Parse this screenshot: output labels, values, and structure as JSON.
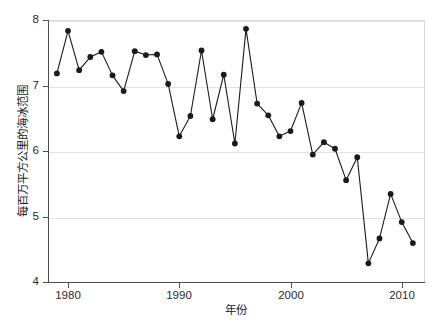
{
  "chart_data": {
    "type": "line",
    "title": "",
    "xlabel": "年份",
    "ylabel": "每百万平方公里的海冰范围",
    "xlim": [
      1978.2,
      2012.0
    ],
    "ylim": [
      4,
      8
    ],
    "grid": true,
    "legend": null,
    "marker": "filled-circle",
    "line_color": "#1a1a1a",
    "marker_color": "#1a1a1a",
    "background_color": "#ffffff",
    "gridline_color": "#e3e3e3",
    "axis_color": "#4d4d4d",
    "x_ticks": [
      1980,
      1990,
      2000,
      2010
    ],
    "y_ticks": [
      4,
      5,
      6,
      7,
      8
    ],
    "x_tick_labels": [
      "1980",
      "1990",
      "2000",
      "2010"
    ],
    "y_tick_labels": [
      "4",
      "5",
      "6",
      "7",
      "8"
    ],
    "x": [
      1979,
      1980,
      1981,
      1982,
      1983,
      1984,
      1985,
      1986,
      1987,
      1988,
      1989,
      1990,
      1991,
      1992,
      1993,
      1994,
      1995,
      1996,
      1997,
      1998,
      1999,
      2000,
      2001,
      2002,
      2003,
      2004,
      2005,
      2006,
      2007,
      2008,
      2009,
      2010,
      2011
    ],
    "values": [
      7.2,
      7.85,
      7.25,
      7.45,
      7.53,
      7.17,
      6.93,
      7.54,
      7.48,
      7.49,
      7.04,
      6.24,
      6.55,
      7.55,
      6.5,
      7.18,
      6.13,
      7.88,
      6.74,
      6.56,
      6.24,
      6.32,
      6.75,
      5.96,
      6.15,
      6.05,
      5.57,
      5.92,
      4.3,
      4.68,
      5.36,
      4.93,
      4.61
    ]
  }
}
